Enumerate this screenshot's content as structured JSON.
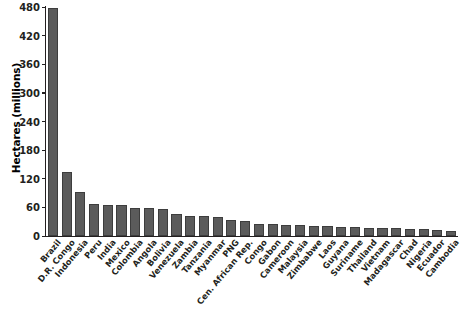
{
  "chart_data": {
    "type": "bar",
    "title": "",
    "xlabel": "",
    "ylabel": "Hectares (millions)",
    "ylim": [
      0,
      480
    ],
    "yticks": [
      0,
      60,
      120,
      180,
      240,
      300,
      360,
      420,
      480
    ],
    "grid": false,
    "legend": null,
    "bar_color": "#5b5b5b",
    "bar_edge_color": "#3d3d3d",
    "axis_color": "#231f20",
    "categories": [
      "Brazil",
      "D.R. Congo",
      "Indonesia",
      "Peru",
      "India",
      "Mexico",
      "Colombia",
      "Angola",
      "Bolivia",
      "Venezuela",
      "Zambia",
      "Tanzania",
      "Myanmar",
      "PNG",
      "Cen. African Rep.",
      "Congo",
      "Gabon",
      "Cameroon",
      "Malaysia",
      "Zimbabwe",
      "Laos",
      "Guyana",
      "Suriname",
      "Thailand",
      "Vietnam",
      "Madagascar",
      "Chad",
      "Nigeria",
      "Ecuador",
      "Cambodia"
    ],
    "values": [
      478,
      134,
      92,
      68,
      66,
      64,
      59,
      58,
      57,
      47,
      43,
      42,
      40,
      33,
      31,
      26,
      25,
      24,
      23,
      21,
      20,
      19,
      18,
      17,
      17,
      16,
      15,
      14,
      13,
      10
    ]
  }
}
